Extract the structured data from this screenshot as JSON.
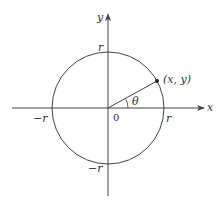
{
  "diagram": {
    "type": "unit-circle-polar",
    "colors": {
      "stroke": "#444444",
      "text": "#333333",
      "point": "#222222",
      "background": "#ffffff"
    },
    "axes": {
      "x_label": "x",
      "y_label": "y",
      "origin_label": "0"
    },
    "circle": {
      "top_label": "r",
      "bottom_label": "−r",
      "left_label": "−r",
      "right_label": "r"
    },
    "point": {
      "label": "(x, y)"
    },
    "angle": {
      "label": "θ"
    }
  }
}
